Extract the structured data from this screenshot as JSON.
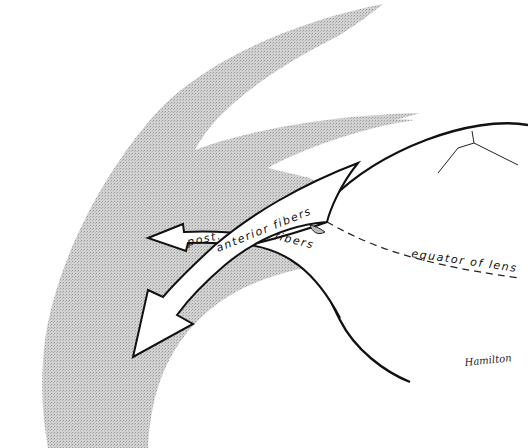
{
  "diagram": {
    "type": "anatomical-illustration",
    "colors": {
      "background": "#ffffff",
      "shaded_region": "#c9c9c9",
      "outline": "#111111",
      "arrow_fill": "#ffffff"
    },
    "labels": {
      "post": "post.",
      "anterior_fibers": "anterior   fibers",
      "fibers": "fibers",
      "equator": "equator  of  lens",
      "signature": "Hamilton"
    },
    "nodes": [
      {
        "id": "ciliary-body",
        "shape": "shaded crescent band"
      },
      {
        "id": "lens",
        "shape": "ellipse (partial)"
      },
      {
        "id": "anterior-fibers-arrow",
        "shape": "curved arrow pointing down-left"
      },
      {
        "id": "posterior-fibers-arrow",
        "shape": "short arrow pointing left"
      },
      {
        "id": "equator-line",
        "shape": "dashed line"
      },
      {
        "id": "lens-suture",
        "shape": "Y-shaped line"
      }
    ]
  }
}
